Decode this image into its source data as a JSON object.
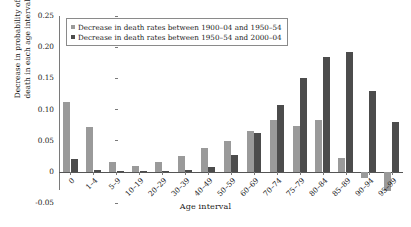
{
  "chart_data": {
    "type": "bar",
    "title": "",
    "xlabel": "Age interval",
    "ylabel_line1": "Decrease in probability of",
    "ylabel_line2": "death in each age interval",
    "ylim": [
      -0.05,
      0.25
    ],
    "ytick_labels": [
      "0.25",
      "0.20",
      "0.15",
      "0.10",
      "0.05",
      "0",
      "-0.05"
    ],
    "ytick_values": [
      0.25,
      0.2,
      0.15,
      0.1,
      0.05,
      0,
      -0.05
    ],
    "grid": false,
    "legend_position": "upper-left",
    "categories": [
      "0",
      "1–4",
      "5–9",
      "10–19",
      "20–29",
      "30–39",
      "40–49",
      "50–59",
      "60–69",
      "70–74",
      "75–79",
      "80–84",
      "85–89",
      "90–94",
      "95–99"
    ],
    "series": [
      {
        "name": "Decrease in death rates between 1900–04 and 1950–54",
        "color": "#9a9a9a",
        "values": [
          0.113,
          0.072,
          0.016,
          0.01,
          0.016,
          0.026,
          0.038,
          0.05,
          0.066,
          0.083,
          0.073,
          0.083,
          0.023,
          -0.01,
          -0.03
        ]
      },
      {
        "name": "Decrease in death rates between 1950–54 and 2000–04",
        "color": "#4c4c4c",
        "values": [
          0.021,
          0.003,
          0.001,
          0.001,
          0.002,
          0.003,
          0.008,
          0.027,
          0.063,
          0.107,
          0.151,
          0.184,
          0.192,
          0.13,
          0.08
        ]
      }
    ]
  }
}
